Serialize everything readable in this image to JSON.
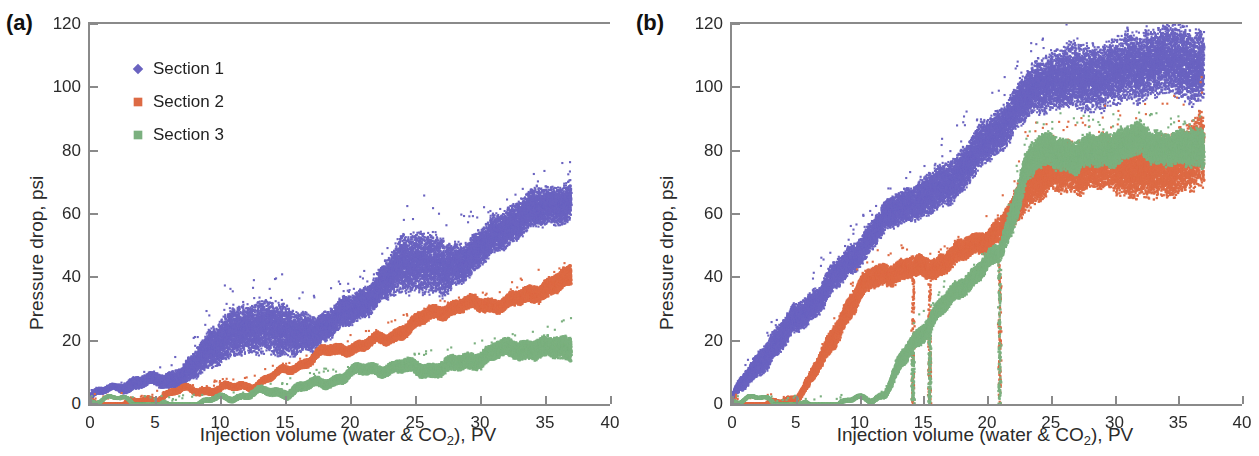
{
  "figure": {
    "width": 1259,
    "height": 456,
    "background": "#ffffff"
  },
  "colors": {
    "section1": "#6a63c0",
    "section2": "#dd6a44",
    "section3": "#7bb07f",
    "axis": "#8a8a8a",
    "text": "#2b2b2b"
  },
  "panels": [
    {
      "id": "a",
      "label": "(a)",
      "xlabel_pre": "Injection volume (water & CO",
      "xlabel_sub": "2",
      "xlabel_post": "), PV",
      "ylabel": "Pressure drop, psi",
      "xticks": [
        "0",
        "5",
        "10",
        "15",
        "20",
        "25",
        "30",
        "35",
        "40"
      ],
      "yticks": [
        "0",
        "20",
        "40",
        "60",
        "80",
        "100",
        "120"
      ],
      "legend": [
        {
          "label": "Section 1",
          "marker": "diamond",
          "color": "#6a63c0"
        },
        {
          "label": "Section 2",
          "marker": "square",
          "color": "#dd6a44"
        },
        {
          "label": "Section 3",
          "marker": "square",
          "color": "#7bb07f"
        }
      ]
    },
    {
      "id": "b",
      "label": "(b)",
      "xlabel_pre": "Injection volume (water & CO",
      "xlabel_sub": "2",
      "xlabel_post": "), PV",
      "ylabel": "Pressure drop, psi",
      "xticks": [
        "0",
        "5",
        "10",
        "15",
        "20",
        "25",
        "30",
        "35",
        "40"
      ],
      "yticks": [
        "0",
        "20",
        "40",
        "60",
        "80",
        "100",
        "120"
      ],
      "legend": [
        {
          "label": "Section 1",
          "marker": "diamond",
          "color": "#6a63c0"
        },
        {
          "label": "Section 2",
          "marker": "square",
          "color": "#dd6a44"
        },
        {
          "label": "Section 3",
          "marker": "square",
          "color": "#7bb07f"
        }
      ]
    }
  ],
  "chart_data": [
    {
      "type": "scatter",
      "panel": "a",
      "title": "(a)",
      "xlabel": "Injection volume (water & CO2), PV",
      "ylabel": "Pressure drop, psi",
      "xlim": [
        0,
        40
      ],
      "ylim": [
        0,
        120
      ],
      "xticks": [
        0,
        5,
        10,
        15,
        20,
        25,
        30,
        35,
        40
      ],
      "yticks": [
        0,
        20,
        40,
        60,
        80,
        100,
        120
      ],
      "grid": false,
      "legend_position": "upper-left-inside",
      "x_data_range": [
        0,
        37
      ],
      "series": [
        {
          "name": "Section 1",
          "color": "#6a63c0",
          "marker": "diamond",
          "description": "Roughly linear rise from ~2 psi at 0 PV to ~65 psi at 37 PV with a wide noisy band; noise amplitude grows with injection volume; pronounced fluctuation bursts between 9-16 PV and 23-28 PV.",
          "x": [
            0,
            1,
            2,
            3,
            4,
            5,
            6,
            7,
            8,
            9,
            10,
            11,
            12,
            13,
            14,
            15,
            16,
            17,
            18,
            19,
            20,
            21,
            22,
            23,
            24,
            25,
            26,
            27,
            28,
            29,
            30,
            31,
            32,
            33,
            34,
            35,
            36,
            37
          ],
          "y_mean": [
            2,
            3,
            4,
            5,
            6,
            7,
            8,
            10,
            12,
            16,
            20,
            22,
            21,
            23,
            24,
            22,
            22,
            24,
            26,
            28,
            30,
            32,
            34,
            37,
            41,
            43,
            43,
            42,
            45,
            47,
            49,
            52,
            55,
            57,
            59,
            61,
            63,
            65
          ],
          "y_lo": [
            1,
            2,
            3,
            3,
            4,
            5,
            6,
            7,
            8,
            11,
            13,
            14,
            13,
            14,
            15,
            13,
            15,
            18,
            21,
            23,
            25,
            27,
            29,
            31,
            33,
            35,
            34,
            33,
            38,
            41,
            43,
            46,
            49,
            51,
            53,
            55,
            57,
            58
          ],
          "y_hi": [
            3,
            4,
            5,
            7,
            8,
            9,
            11,
            14,
            17,
            24,
            28,
            31,
            29,
            32,
            34,
            31,
            29,
            30,
            31,
            33,
            35,
            37,
            40,
            45,
            53,
            55,
            55,
            53,
            53,
            54,
            56,
            59,
            62,
            64,
            66,
            68,
            70,
            72
          ]
        },
        {
          "name": "Section 2",
          "color": "#dd6a44",
          "marker": "square",
          "description": "Flat near 0-1 psi until ~4 PV, then steady near-linear rise to ~38 psi at 37 PV with a narrow band.",
          "x": [
            0,
            1,
            2,
            3,
            4,
            5,
            6,
            7,
            8,
            9,
            10,
            11,
            12,
            13,
            14,
            15,
            16,
            17,
            18,
            19,
            20,
            21,
            22,
            23,
            24,
            25,
            26,
            27,
            28,
            29,
            30,
            31,
            32,
            33,
            34,
            35,
            36,
            37
          ],
          "y_mean": [
            0.5,
            0.6,
            0.7,
            0.8,
            1,
            1.5,
            2,
            2.5,
            3,
            4,
            5,
            6,
            7,
            8,
            9,
            10,
            11,
            13,
            15,
            16,
            18,
            19,
            21,
            22,
            24,
            25,
            27,
            28,
            29,
            30,
            31,
            32,
            33,
            34,
            35,
            36,
            37,
            38
          ],
          "y_lo": [
            0,
            0,
            0,
            0,
            0.3,
            0.8,
            1.2,
            1.7,
            2.2,
            3,
            4,
            5,
            6,
            7,
            8,
            9,
            10,
            11.5,
            13.5,
            14.5,
            16.5,
            17.5,
            19.5,
            20.5,
            22,
            23,
            25,
            26,
            27,
            28,
            29,
            30,
            31,
            32,
            33,
            34,
            34.5,
            35
          ],
          "y_hi": [
            1.2,
            1.3,
            1.4,
            1.6,
            2,
            2.4,
            3,
            3.6,
            4.2,
            5.2,
            6.2,
            7.2,
            8.2,
            9.2,
            10.2,
            11.2,
            12.5,
            14.5,
            16.5,
            17.8,
            19.8,
            21,
            23,
            24,
            26.5,
            27.5,
            29.5,
            30.5,
            31.5,
            32.5,
            33.5,
            34.5,
            35.5,
            37,
            38.5,
            40,
            41,
            42
          ]
        },
        {
          "name": "Section 3",
          "color": "#7bb07f",
          "marker": "square",
          "description": "Essentially 0 psi until ~12 PV, then gentle near-linear rise to ~19 psi at 37 PV.",
          "x": [
            0,
            2,
            4,
            6,
            8,
            10,
            11,
            12,
            13,
            14,
            15,
            16,
            17,
            18,
            19,
            20,
            21,
            22,
            23,
            24,
            25,
            26,
            27,
            28,
            29,
            30,
            31,
            32,
            33,
            34,
            35,
            36,
            37
          ],
          "y_mean": [
            0.2,
            0.2,
            0.2,
            0.3,
            0.4,
            0.6,
            1,
            1.5,
            2.5,
            3.5,
            4.5,
            6,
            7,
            7.5,
            8,
            8.5,
            9,
            9.5,
            10,
            11,
            11.5,
            12,
            12.5,
            13,
            13.5,
            14,
            15,
            15.5,
            16,
            17,
            17.5,
            18,
            19
          ],
          "y_lo": [
            0,
            0,
            0,
            0,
            0,
            0,
            0.3,
            0.8,
            1.6,
            2.5,
            3.4,
            4.8,
            5.8,
            6.3,
            6.8,
            7.2,
            7.6,
            8,
            8.4,
            9.2,
            9.6,
            10,
            10.4,
            10.8,
            11.2,
            11.6,
            12.4,
            12.8,
            13.2,
            14,
            14.4,
            14.8,
            15.5
          ],
          "y_hi": [
            0.6,
            0.6,
            0.6,
            0.8,
            1,
            1.3,
            1.8,
            2.4,
            3.6,
            4.8,
            6,
            7.6,
            8.6,
            9.2,
            9.8,
            10.4,
            11,
            11.6,
            12.2,
            13.4,
            14,
            14.6,
            15.2,
            15.8,
            16.4,
            17,
            18,
            18.6,
            19.2,
            20.4,
            21,
            22,
            23.5
          ]
        }
      ]
    },
    {
      "type": "scatter",
      "panel": "b",
      "title": "(b)",
      "xlabel": "Injection volume (water & CO2), PV",
      "ylabel": "Pressure drop, psi",
      "xlim": [
        0,
        40
      ],
      "ylim": [
        0,
        120
      ],
      "xticks": [
        0,
        5,
        10,
        15,
        20,
        25,
        30,
        35,
        40
      ],
      "yticks": [
        0,
        20,
        40,
        60,
        80,
        100,
        120
      ],
      "grid": false,
      "legend_position": "upper-left-inside",
      "x_data_range": [
        0,
        37
      ],
      "dropouts": [
        14.2,
        15.5,
        21.0
      ],
      "series": [
        {
          "name": "Section 1",
          "color": "#6a63c0",
          "marker": "diamond",
          "description": "S-shaped rise from ~2 psi at 0 PV, steep through 5-22 PV, saturating in a very noisy plateau of roughly 95-118 psi beyond 25 PV; band widens greatly at high injection volume; isolated low outliers near 15.5 and 21 PV.",
          "x": [
            0,
            1,
            2,
            3,
            4,
            5,
            6,
            7,
            8,
            9,
            10,
            11,
            12,
            13,
            14,
            15,
            16,
            17,
            18,
            19,
            20,
            21,
            22,
            23,
            24,
            25,
            26,
            27,
            28,
            29,
            30,
            31,
            32,
            33,
            34,
            35,
            36,
            37
          ],
          "y_mean": [
            2,
            6,
            11,
            16,
            21,
            26,
            31,
            36,
            41,
            45,
            49,
            53,
            57,
            60,
            63,
            64,
            67,
            71,
            75,
            79,
            83,
            86,
            90,
            94,
            97,
            99,
            100,
            101,
            102,
            103,
            103,
            104,
            104,
            105,
            105,
            106,
            106,
            106
          ],
          "y_lo": [
            1,
            3,
            7,
            11,
            16,
            21,
            26,
            31,
            36,
            40,
            44,
            48,
            52,
            55,
            57,
            57,
            60,
            64,
            68,
            72,
            76,
            79,
            83,
            87,
            90,
            92,
            92,
            93,
            93,
            94,
            94,
            94,
            94,
            95,
            95,
            95,
            95,
            95
          ],
          "y_hi": [
            3,
            9,
            15,
            21,
            26,
            31,
            36,
            41,
            46,
            50,
            54,
            58,
            62,
            66,
            69,
            71,
            75,
            79,
            83,
            87,
            91,
            94,
            98,
            103,
            108,
            112,
            114,
            115,
            116,
            117,
            117,
            118,
            118,
            119,
            119,
            120,
            120,
            120
          ]
        },
        {
          "name": "Section 2",
          "color": "#dd6a44",
          "marker": "square",
          "description": "Flat near 0 psi until ~5 PV, steep rise to a ~40-48 psi shoulder between 9-15 PV, sharp dropouts to near 0 at about 14.2 and 15.5 PV, second rise to ~55-65 psi by 22 PV, then a broad noisy plateau around 65-88 psi to 37 PV.",
          "x": [
            0,
            2,
            4,
            5,
            6,
            7,
            8,
            9,
            10,
            11,
            12,
            13,
            14,
            15,
            16,
            17,
            18,
            19,
            20,
            21,
            22,
            23,
            24,
            25,
            26,
            27,
            28,
            29,
            30,
            31,
            32,
            33,
            34,
            35,
            36,
            37
          ],
          "y_mean": [
            0.5,
            0.5,
            0.8,
            2,
            6,
            12,
            20,
            29,
            36,
            40,
            42,
            43,
            43,
            42,
            42,
            44,
            46,
            49,
            52,
            55,
            60,
            70,
            73,
            74,
            74,
            74,
            75,
            75,
            76,
            76,
            76,
            76,
            77,
            77,
            78,
            79
          ],
          "y_lo": [
            0,
            0,
            0,
            1,
            4,
            9,
            16,
            25,
            32,
            37,
            39,
            40,
            40,
            39,
            39,
            41,
            43,
            46,
            49,
            52,
            55,
            62,
            65,
            66,
            65,
            65,
            66,
            66,
            66,
            66,
            66,
            65,
            66,
            66,
            66,
            65
          ],
          "y_hi": [
            1,
            1,
            1.6,
            3,
            8,
            15,
            24,
            33,
            40,
            44,
            46,
            47,
            47,
            46,
            46,
            48,
            50,
            53,
            56,
            60,
            66,
            78,
            81,
            82,
            82,
            82,
            83,
            84,
            85,
            85,
            86,
            86,
            87,
            88,
            89,
            91
          ]
        },
        {
          "name": "Section 3",
          "color": "#7bb07f",
          "marker": "square",
          "description": "Essentially 0 psi until ~12 PV, dropouts to near 0 at about 14.2, 15.5 and 21 PV, rapid rise to ~55-65 psi by 22-23 PV, then a noisy plateau around 70-88 psi that slightly decays toward 37 PV.",
          "x": [
            0,
            4,
            8,
            11,
            12,
            13,
            14,
            15,
            16,
            17,
            18,
            19,
            20,
            21,
            22,
            23,
            24,
            25,
            26,
            27,
            28,
            29,
            30,
            31,
            32,
            33,
            34,
            35,
            36,
            37
          ],
          "y_mean": [
            0.3,
            0.3,
            0.4,
            0.5,
            2,
            10,
            18,
            24,
            30,
            34,
            38,
            41,
            44,
            46,
            58,
            73,
            78,
            80,
            80,
            79,
            80,
            80,
            81,
            81,
            81,
            80,
            80,
            80,
            81,
            82
          ],
          "y_lo": [
            0,
            0,
            0,
            0,
            1,
            7,
            15,
            21,
            27,
            31,
            35,
            38,
            41,
            43,
            52,
            68,
            73,
            75,
            75,
            74,
            75,
            75,
            75,
            76,
            76,
            75,
            75,
            75,
            75,
            76
          ],
          "y_hi": [
            0.7,
            0.7,
            0.9,
            1.2,
            3,
            13,
            21,
            27,
            33,
            37,
            41,
            44,
            47,
            49,
            64,
            79,
            84,
            86,
            86,
            85,
            86,
            86,
            87,
            87,
            87,
            86,
            86,
            86,
            88,
            90
          ]
        }
      ]
    }
  ]
}
